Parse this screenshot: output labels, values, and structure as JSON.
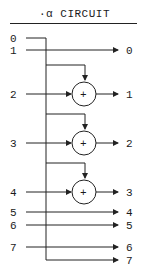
{
  "title": "·α CIRCUIT",
  "inputs": [
    "0",
    "1",
    "2",
    "3",
    "4",
    "5",
    "6",
    "7"
  ],
  "outputs": [
    "0",
    "1",
    "2",
    "3",
    "4",
    "5",
    "6",
    "7"
  ],
  "adder_symbol": "+",
  "colors": {
    "line": "#222222",
    "background": "#ffffff"
  }
}
